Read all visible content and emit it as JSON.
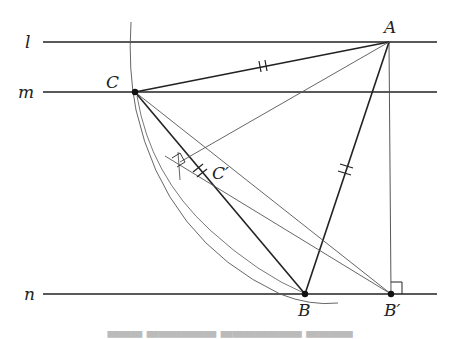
{
  "figure": {
    "lines": [
      {
        "name": "l",
        "label": "l",
        "y": 42
      },
      {
        "name": "m",
        "label": "m",
        "y": 92
      },
      {
        "name": "n",
        "label": "n",
        "y": 294
      }
    ],
    "points": {
      "A": {
        "label": "A",
        "x": 389,
        "y": 42
      },
      "C": {
        "label": "C",
        "x": 135,
        "y": 92
      },
      "B": {
        "label": "B",
        "x": 305,
        "y": 294
      },
      "Bp": {
        "label": "B′",
        "x": 391,
        "y": 294
      },
      "Cp": {
        "label": "C′",
        "x": 192,
        "y": 170
      }
    },
    "segments": [
      "AC",
      "AB",
      "CB",
      "AB′ (perpendicular to n)",
      "CB′",
      "AC′"
    ],
    "equal_marks": [
      "AC",
      "AB",
      "CC′ region"
    ],
    "right_angle_marks": [
      "at B′",
      "at foot of perpendicular near C′"
    ],
    "arc": "circle centered at A through C and B",
    "colors": {
      "stroke": "#222222",
      "thin": "#555555",
      "background": "#ffffff"
    }
  },
  "caption": {
    "visible": "partially cropped (unreadable)"
  }
}
